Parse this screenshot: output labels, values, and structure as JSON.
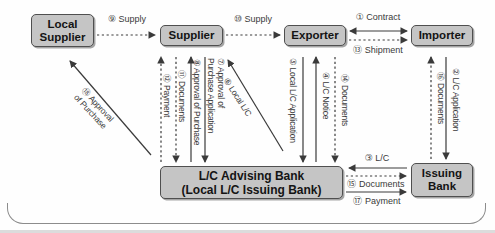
{
  "diagram_title": "Local L/C transaction flow",
  "colors": {
    "node_fill": "#c5c5c5",
    "node_border": "#4f4f4f",
    "arrow": "#3a3a3a",
    "bracket": "#8c8c8c"
  },
  "nodes": {
    "local_supplier": "Local\nSupplier",
    "supplier": "Supplier",
    "exporter": "Exporter",
    "importer": "Importer",
    "advising_bank": "L/C Advising Bank\n(Local L/C Issuing Bank)",
    "issuing_bank": "Issuing\nBank"
  },
  "flows": [
    {
      "label": "① Contract",
      "from": "Exporter",
      "to": "Importer",
      "line": "solid",
      "bidirectional": true
    },
    {
      "label": "② L/C Application",
      "from": "Importer",
      "to": "Issuing Bank",
      "line": "solid",
      "bidirectional": false
    },
    {
      "label": "③ L/C",
      "from": "Issuing Bank",
      "to": "L/C Advising Bank",
      "line": "solid",
      "bidirectional": false
    },
    {
      "label": "④ L/C Notice",
      "from": "L/C Advising Bank",
      "to": "Exporter",
      "line": "solid",
      "bidirectional": false
    },
    {
      "label": "⑤ Local L/C Application",
      "from": "Exporter",
      "to": "L/C Advising Bank",
      "line": "solid",
      "bidirectional": false
    },
    {
      "label": "⑥ Local L/C",
      "from": "L/C Advising Bank",
      "to": "Supplier",
      "line": "solid",
      "bidirectional": false
    },
    {
      "label": "⑦ Approval of\nPurchase Application",
      "from": "Supplier",
      "to": "L/C Advising Bank",
      "line": "solid",
      "bidirectional": false
    },
    {
      "label": "⑧ Approval of Purchase",
      "from": "L/C Advising Bank",
      "to": "Supplier",
      "line": "solid",
      "bidirectional": false
    },
    {
      "label": "⑨ Supply",
      "from": "Local Supplier",
      "to": "Supplier",
      "line": "dashed",
      "bidirectional": false
    },
    {
      "label": "⑩ Supply",
      "from": "Supplier",
      "to": "Exporter",
      "line": "dashed",
      "bidirectional": false
    },
    {
      "label": "⑪ Documents",
      "from": "Supplier",
      "to": "L/C Advising Bank",
      "line": "dashed",
      "bidirectional": false
    },
    {
      "label": "⑫ Payment",
      "from": "L/C Advising Bank",
      "to": "Supplier",
      "line": "dashed",
      "bidirectional": false
    },
    {
      "label": "⑬ Shipment",
      "from": "Exporter",
      "to": "Importer",
      "line": "dashed",
      "bidirectional": false
    },
    {
      "label": "⑭ Documents",
      "from": "Exporter",
      "to": "L/C Advising Bank",
      "line": "dashed",
      "bidirectional": false
    },
    {
      "label": "⑮ Documents",
      "from": "L/C Advising Bank",
      "to": "Issuing Bank",
      "line": "dashed",
      "bidirectional": false
    },
    {
      "label": "⑯ Documents",
      "from": "Issuing Bank",
      "to": "Importer",
      "line": "dashed",
      "bidirectional": false
    },
    {
      "label": "⑰ Payment",
      "from": "L/C Advising Bank",
      "to": "Issuing Bank",
      "line": "solid",
      "bidirectional": false
    },
    {
      "label": "⑱ Approval\nof Purchase",
      "from": "L/C Advising Bank",
      "to": "Local Supplier",
      "line": "solid",
      "bidirectional": false
    }
  ]
}
